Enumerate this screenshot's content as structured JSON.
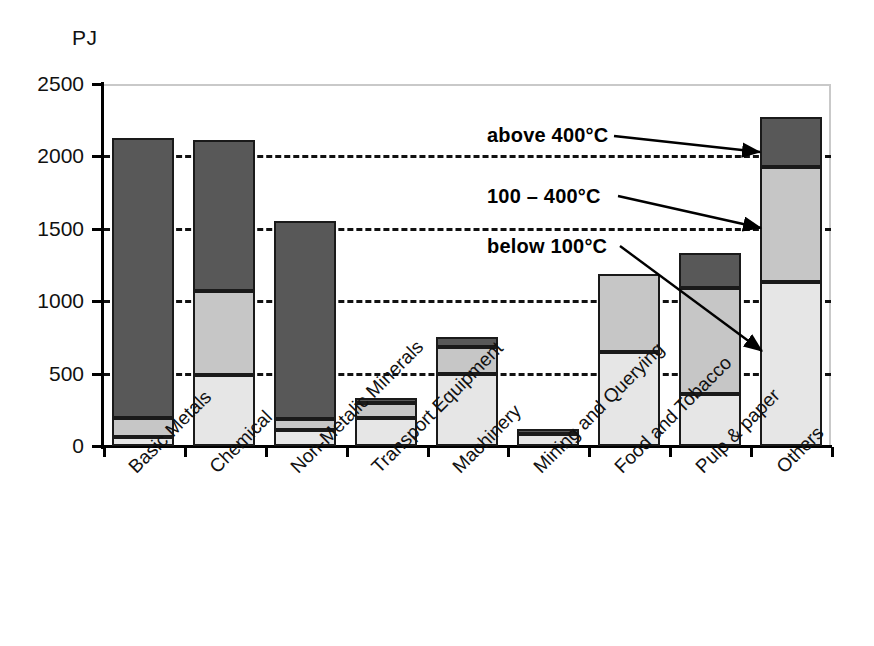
{
  "chart_data": {
    "type": "bar",
    "stacked": true,
    "title": "",
    "subtitle": "",
    "xlabel": "",
    "ylabel": "PJ",
    "unit_label": "PJ",
    "ylim": [
      0,
      2500
    ],
    "yticks": [
      0,
      500,
      1000,
      1500,
      2000,
      2500
    ],
    "ytick_labels": [
      "0",
      "500",
      "1000",
      "1500",
      "2000",
      "2500"
    ],
    "grid": "horizontal-dashed",
    "legend_position": "inline-annotations",
    "categories": [
      "Basic Metals",
      "Chemical",
      "Non-Metalic Minerals",
      "Transport Equipment",
      "Machinery",
      "Mining and Querying",
      "Food and Tobacco",
      "Pulp & paper",
      "Others"
    ],
    "series": [
      {
        "name": "below 100°C",
        "color": "#e6e6e6",
        "values": [
          65,
          490,
          110,
          190,
          500,
          85,
          650,
          360,
          1130
        ]
      },
      {
        "name": "100 – 400°C",
        "color": "#c6c6c6",
        "values": [
          125,
          580,
          75,
          110,
          185,
          0,
          540,
          730,
          800
        ]
      },
      {
        "name": "above 400°C",
        "color": "#585858",
        "values": [
          1935,
          1040,
          1370,
          30,
          70,
          30,
          0,
          240,
          345
        ]
      }
    ],
    "totals": [
      2125,
      2110,
      1555,
      330,
      755,
      115,
      1190,
      1330,
      2275
    ]
  },
  "annotations": [
    {
      "id": "above-400",
      "text": "above 400°C",
      "points_to": "Others / top dark segment"
    },
    {
      "id": "range-100-400",
      "text": "100 – 400°C",
      "points_to": "Others / middle gray segment"
    },
    {
      "id": "below-100",
      "text": "below 100°C",
      "points_to": "Others / bottom light segment"
    }
  ]
}
